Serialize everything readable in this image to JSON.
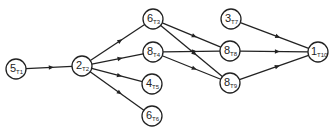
{
  "diagram": {
    "type": "task-precedence-graph",
    "colors": {
      "stroke": "#222222",
      "background": "#ffffff"
    },
    "node_radius": 10,
    "nodes": [
      {
        "id": "T1",
        "value": "5",
        "label": "T1",
        "x": 16,
        "y": 69
      },
      {
        "id": "T2",
        "value": "2",
        "label": "T2",
        "x": 82,
        "y": 66
      },
      {
        "id": "T3",
        "value": "6",
        "label": "T3",
        "x": 153,
        "y": 19
      },
      {
        "id": "T4",
        "value": "8",
        "label": "T4",
        "x": 153,
        "y": 52
      },
      {
        "id": "T5",
        "value": "4",
        "label": "T5",
        "x": 152,
        "y": 84
      },
      {
        "id": "T6",
        "value": "6",
        "label": "T6",
        "x": 152,
        "y": 116
      },
      {
        "id": "T7",
        "value": "3",
        "label": "T7",
        "x": 231,
        "y": 19
      },
      {
        "id": "T8",
        "value": "8",
        "label": "T8",
        "x": 230,
        "y": 51
      },
      {
        "id": "T9",
        "value": "8",
        "label": "T9",
        "x": 230,
        "y": 83
      },
      {
        "id": "T10",
        "value": "1",
        "label": "T10",
        "x": 318,
        "y": 52
      }
    ],
    "edges": [
      {
        "from": "T1",
        "to": "T2"
      },
      {
        "from": "T2",
        "to": "T3"
      },
      {
        "from": "T2",
        "to": "T4"
      },
      {
        "from": "T2",
        "to": "T5"
      },
      {
        "from": "T2",
        "to": "T6"
      },
      {
        "from": "T3",
        "to": "T8"
      },
      {
        "from": "T3",
        "to": "T9"
      },
      {
        "from": "T4",
        "to": "T8"
      },
      {
        "from": "T4",
        "to": "T9"
      },
      {
        "from": "T7",
        "to": "T10"
      },
      {
        "from": "T8",
        "to": "T10"
      },
      {
        "from": "T9",
        "to": "T10"
      }
    ]
  }
}
